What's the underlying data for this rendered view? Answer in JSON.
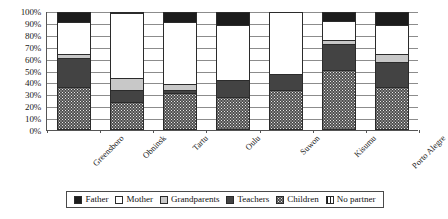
{
  "chart_data": {
    "type": "bar",
    "subtype": "100% stacked column",
    "title": "",
    "xlabel": "",
    "ylabel": "",
    "ylim": [
      0,
      100
    ],
    "y_tick_labels": [
      "0%",
      "10%",
      "20%",
      "30%",
      "40%",
      "50%",
      "60%",
      "70%",
      "80%",
      "90%",
      "100%"
    ],
    "y_tick_values": [
      0,
      10,
      20,
      30,
      40,
      50,
      60,
      70,
      80,
      90,
      100
    ],
    "grid": true,
    "legend_position": "bottom",
    "categories": [
      "Greensboro",
      "Obninsk",
      "Tartu",
      "Oulu",
      "Suwon",
      "Kisumu",
      "Porto Alegre"
    ],
    "series": [
      {
        "name": "Children",
        "fill": "dotted",
        "color": "#4e4e4e",
        "values": [
          35,
          22,
          30,
          27,
          33,
          50,
          35
        ]
      },
      {
        "name": "Teachers",
        "fill": "dark-gray",
        "color": "#434343",
        "values": [
          25,
          11,
          3,
          14,
          14,
          22,
          22
        ]
      },
      {
        "name": "Grandparents",
        "fill": "light-gray",
        "color": "#c8c8c8",
        "values": [
          4,
          10,
          5,
          0,
          0,
          4,
          7
        ]
      },
      {
        "name": "Mother",
        "fill": "white",
        "color": "#ffffff",
        "values": [
          27,
          56,
          53,
          48,
          53,
          16,
          25
        ]
      },
      {
        "name": "Father",
        "fill": "black",
        "color": "#1c1c1c",
        "values": [
          9,
          1,
          9,
          11,
          0,
          8,
          11
        ]
      },
      {
        "name": "No partner",
        "fill": "vertical-lines",
        "color": "#ffffff",
        "values": [
          0,
          0,
          0,
          0,
          0,
          0,
          0
        ]
      }
    ]
  },
  "legend": {
    "items": [
      {
        "label": "Father",
        "swatch": "father-swatch"
      },
      {
        "label": "Mother",
        "swatch": "mother-swatch"
      },
      {
        "label": "Grandparents",
        "swatch": "grandparents-swatch"
      },
      {
        "label": "Teachers",
        "swatch": "teachers-swatch"
      },
      {
        "label": "Children",
        "swatch": "children-swatch"
      },
      {
        "label": "No partner",
        "swatch": "no-partner-swatch"
      }
    ]
  }
}
